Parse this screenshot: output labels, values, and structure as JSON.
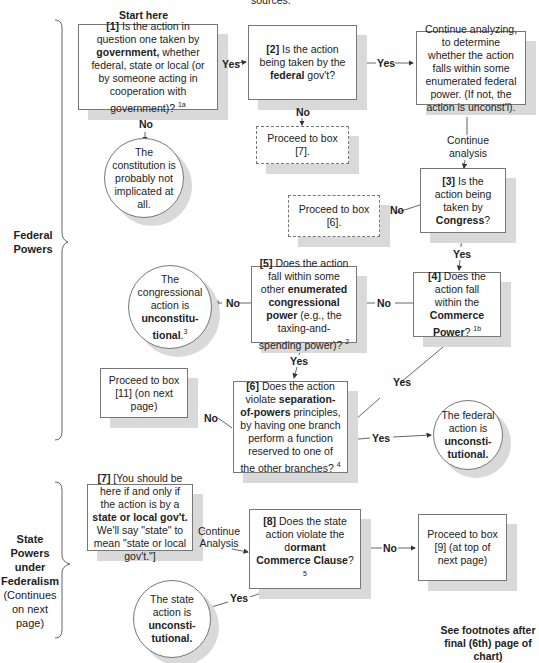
{
  "header": {
    "cut_text": "sources."
  },
  "start_label": "Start here",
  "sections": [
    {
      "title": "Federal Powers",
      "subtitle": ""
    },
    {
      "title": "State Powers under Federalism",
      "subtitle": "(Continues on next page)"
    }
  ],
  "boxes": {
    "b1": {
      "num": "[1]",
      "pre": " Is the action in question one taken by ",
      "bold": "government,",
      "post": " whether federal, state or  local (or by someone acting in cooperation with government)? ",
      "sup": "1a"
    },
    "b2": {
      "num": "[2]",
      "pre": " Is the action being taken by the ",
      "bold": "federal",
      "post": " gov't?"
    },
    "continue_analyzing": {
      "text": "Continue analyzing, to determine whether the action falls within some enumerated federal power. (If not, the action is unconst'l)."
    },
    "proceed7": {
      "text": "Proceed to box [7]."
    },
    "b3": {
      "num": "[3]",
      "pre": " Is the action being taken by ",
      "bold": "Congress",
      "post": "?"
    },
    "proceed6": {
      "text": "Proceed to box [6]."
    },
    "b4": {
      "num": "[4]",
      "pre": " Does the action fall within the ",
      "bold": "Commerce Power",
      "post": "? ",
      "sup": "1b"
    },
    "b5": {
      "num": "[5]",
      "pre": " Does  the action fall within some other ",
      "bold": "enumerated congressional power",
      "post": " (e.g., the taxing-and-spending power)? ",
      "sup": "2"
    },
    "b6": {
      "num": "[6]",
      "pre": " Does the action violate ",
      "bold": "separation-of-powers",
      "post": " principles, by having one branch perform a function reserved to one of the other branches? ",
      "sup": "4"
    },
    "proceed11": {
      "text": "Proceed to box [11] (on next page)"
    },
    "b7": {
      "num": "[7]",
      "pre": " [You should be here if and only if the action is by a ",
      "bold": "state or local gov't.",
      "post": " We'll say \"state\" to mean \"state or local gov't.\"]"
    },
    "b8": {
      "num": "[8]",
      "pre": " Does the state action violate the d",
      "bold": "ormant Commerce Clause",
      "post": "? ",
      "sup": "5"
    },
    "proceed9": {
      "text": "Proceed to box [9] (at top of next page)"
    }
  },
  "circles": {
    "not_implicated": {
      "text": "The constitution is probably not implicated at all."
    },
    "congress_unconst": {
      "pre": "The congressional action is ",
      "bold": "unconstitu-tional",
      "post": ".",
      "sup": "3"
    },
    "federal_unconst": {
      "pre": "The federal action is ",
      "bold": "unconsti-tutional."
    },
    "state_unconst": {
      "pre": "The state action is ",
      "bold": "unconsti-tutional."
    }
  },
  "edge_labels": {
    "yes_1_2": "Yes",
    "no_1": "No",
    "yes_2": "Yes",
    "no_2": "No",
    "continue_analysis": "Continue analysis",
    "no_3": "No",
    "yes_3": "Yes",
    "no_4": "No",
    "no_5": "No",
    "yes_5": "Yes",
    "yes_4": "Yes",
    "no_6": "No",
    "yes_6": "Yes",
    "continue_analysis_7": "Continue Analysis",
    "no_8": "No",
    "yes_8": "Yes"
  },
  "footnote": "See footnotes after final (6th) page of chart)"
}
